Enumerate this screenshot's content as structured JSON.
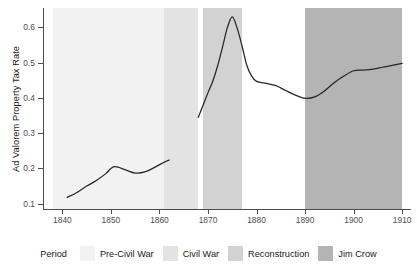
{
  "chart_data": {
    "type": "line",
    "title": "",
    "subtitle": "",
    "xlabel": "",
    "ylabel": "Ad Valorem Property Tax Rate",
    "xlim": [
      1836,
      1911
    ],
    "ylim": [
      0.085,
      0.655
    ],
    "grid": false,
    "legend_position": "bottom",
    "legend_title": "Period",
    "x_ticks": [
      1840,
      1850,
      1860,
      1870,
      1880,
      1890,
      1900,
      1910
    ],
    "x_tick_labels": [
      "1840",
      "1850",
      "1860",
      "1870",
      "1880",
      "1890",
      "1900",
      "1910"
    ],
    "y_ticks": [
      0.1,
      0.2,
      0.3,
      0.4,
      0.5,
      0.6
    ],
    "y_tick_labels": [
      "0.1",
      "0.2",
      "0.3",
      "0.4",
      "0.5",
      "0.6"
    ],
    "shaded_periods": [
      {
        "name": "Pre-Civil War",
        "start": 1838,
        "end": 1861,
        "color": "#f2f2f2"
      },
      {
        "name": "Civil War",
        "start": 1861,
        "end": 1868,
        "color": "#e3e3e3"
      },
      {
        "name": "Reconstruction",
        "start": 1869,
        "end": 1877,
        "color": "#d2d2d2"
      },
      {
        "name": "Jim Crow",
        "start": 1890,
        "end": 1910,
        "color": "#b4b4b4"
      }
    ],
    "series": [
      {
        "name": "Ad Valorem Property Tax Rate",
        "color": "#262626",
        "segments": [
          {
            "label": "antebellum",
            "x": [
              1841,
              1843,
              1845,
              1847,
              1849,
              1850,
              1851,
              1853,
              1855,
              1857,
              1859,
              1861,
              1862
            ],
            "y": [
              0.118,
              0.132,
              0.15,
              0.166,
              0.186,
              0.2,
              0.205,
              0.196,
              0.187,
              0.19,
              0.203,
              0.218,
              0.224
            ]
          },
          {
            "label": "postbellum",
            "x": [
              1868,
              1869,
              1870,
              1871,
              1872,
              1873,
              1874,
              1875,
              1876,
              1877,
              1878,
              1879,
              1880,
              1882,
              1884,
              1886,
              1888,
              1890,
              1892,
              1894,
              1896,
              1898,
              1900,
              1902,
              1904,
              1906,
              1908,
              1910
            ],
            "y": [
              0.345,
              0.38,
              0.415,
              0.448,
              0.492,
              0.545,
              0.6,
              0.63,
              0.598,
              0.548,
              0.492,
              0.462,
              0.447,
              0.441,
              0.435,
              0.421,
              0.408,
              0.399,
              0.403,
              0.42,
              0.443,
              0.462,
              0.477,
              0.479,
              0.482,
              0.487,
              0.492,
              0.498
            ]
          }
        ]
      }
    ]
  },
  "axes": {
    "y_title": "Ad Valorem Property Tax Rate"
  },
  "legend": {
    "title": "Period",
    "items": [
      {
        "label": "Pre-Civil War",
        "color": "#f2f2f2"
      },
      {
        "label": "Civil War",
        "color": "#e3e3e3"
      },
      {
        "label": "Reconstruction",
        "color": "#d2d2d2"
      },
      {
        "label": "Jim Crow",
        "color": "#b4b4b4"
      }
    ]
  }
}
